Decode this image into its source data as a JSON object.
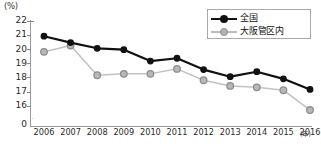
{
  "unit_label": "(%)",
  "title_clipped": "",
  "axis": {
    "y_ticks": [
      "22",
      "21",
      "20",
      "19",
      "18",
      "17",
      "16",
      "0"
    ],
    "y_break": true,
    "x_unit": "(年)",
    "x_ticks": [
      "2006",
      "2007",
      "2008",
      "2009",
      "2010",
      "2011",
      "2012",
      "2013",
      "2014",
      "2015",
      "2016"
    ]
  },
  "legend": {
    "position": "top-right",
    "items": [
      {
        "label": "全国",
        "marker": "filled-circle",
        "color": "#111111"
      },
      {
        "label": "大阪管区内",
        "marker": "open-circle",
        "color": "#b4b4b4"
      }
    ]
  },
  "chart_data": {
    "type": "line",
    "title": "",
    "xlabel": "(年)",
    "ylabel": "(%)",
    "ylim": [
      15.5,
      22
    ],
    "grid": false,
    "legend_position": "top-right",
    "axis_break": "between 16 and 0",
    "categories": [
      "2006",
      "2007",
      "2008",
      "2009",
      "2010",
      "2011",
      "2012",
      "2013",
      "2014",
      "2015",
      "2016"
    ],
    "series": [
      {
        "name": "全国",
        "color": "#111111",
        "marker": "filled-circle",
        "values": [
          20.9,
          20.45,
          20.05,
          19.95,
          19.15,
          19.35,
          18.55,
          18.05,
          18.4,
          17.9,
          17.15
        ]
      },
      {
        "name": "大阪管区内",
        "color": "#b4b4b4",
        "marker": "open-circle",
        "values": [
          19.8,
          20.25,
          18.15,
          18.25,
          18.25,
          18.6,
          17.8,
          17.4,
          17.3,
          17.1,
          15.7
        ]
      }
    ]
  }
}
